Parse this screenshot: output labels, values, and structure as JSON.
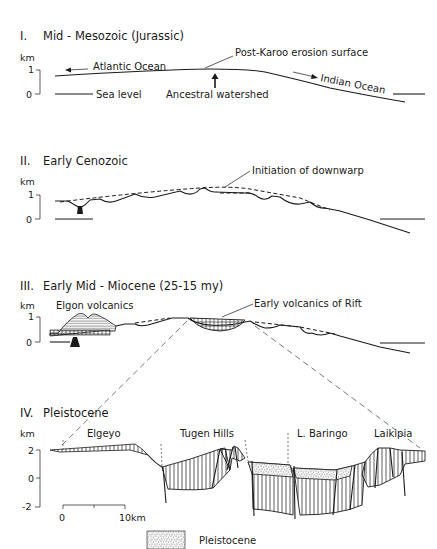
{
  "figure": {
    "sections": [
      {
        "numeral": "I.",
        "title": "Mid - Mesozoic (Jurassic)",
        "axis": {
          "unit": "km",
          "ticks": [
            "1",
            "0"
          ]
        },
        "labels": {
          "surface": "Post-Karoo erosion surface",
          "west": "Atlantic Ocean",
          "east": "Indian Ocean",
          "sea_level": "Sea level",
          "watershed": "Ancestral watershed"
        }
      },
      {
        "numeral": "II.",
        "title": "Early Cenozoic",
        "axis": {
          "unit": "km",
          "ticks": [
            "1",
            "0"
          ]
        },
        "labels": {
          "downwarp": "Initiation of downwarp"
        }
      },
      {
        "numeral": "III.",
        "title": "Early Mid - Miocene (25-15 my)",
        "axis": {
          "unit": "km",
          "ticks": [
            "1",
            "0"
          ]
        },
        "labels": {
          "elgon": "Elgon volcanics",
          "rift_volcanics": "Early volcanics of Rift"
        }
      },
      {
        "numeral": "IV.",
        "title": "Pleistocene",
        "axis": {
          "unit": "km",
          "ticks": [
            "2",
            "0",
            "-2"
          ]
        },
        "labels": {
          "elgeyo": "Elgeyo",
          "tugen": "Tugen Hills",
          "baringo": "L. Baringo",
          "laikipia": "Laikipia"
        },
        "scale_bar": {
          "start": "0",
          "end": "10km"
        }
      }
    ],
    "legend": [
      {
        "pattern": "stipple",
        "label": "Pleistocene"
      }
    ]
  }
}
